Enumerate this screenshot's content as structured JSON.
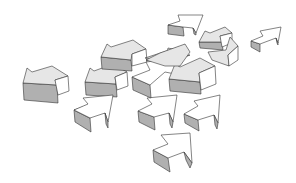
{
  "illustration": {
    "title": "",
    "description": "Scattered 3D arrows pointing in different directions",
    "colors": {
      "background": "#ffffff",
      "top_face": "#e6e6e6",
      "side_face": "#b0b0b0",
      "light_face": "#ffffff",
      "stroke": "#333333"
    },
    "arrows": [
      {
        "name": "arrow-left-far",
        "faces": [
          {
            "pts": "23,83 57,85 58,103 24,100",
            "fill": "#b0b0b0"
          },
          {
            "pts": "23,83 27,68 32,72 52,66 68,76 55,80 57,85",
            "fill": "#e6e6e6"
          },
          {
            "pts": "55,80 68,76 69,91 58,95",
            "fill": "#ffffff"
          }
        ]
      },
      {
        "name": "arrow-left-mid",
        "faces": [
          {
            "pts": "85,82 116,84 117,97 86,95",
            "fill": "#b0b0b0"
          },
          {
            "pts": "85,82 90,68 94,71 113,64 127,72 115,77 116,84",
            "fill": "#e6e6e6"
          },
          {
            "pts": "115,77 127,72 128,86 117,90",
            "fill": "#ffffff"
          }
        ]
      },
      {
        "name": "arrow-left-upper",
        "faces": [
          {
            "pts": "101,57 131,60 132,71 102,69",
            "fill": "#b0b0b0"
          },
          {
            "pts": "101,57 107,44 111,47 133,40 146,49 132,54 131,60",
            "fill": "#e6e6e6"
          },
          {
            "pts": "132,54 146,49 147,62 132,66",
            "fill": "#ffffff"
          }
        ]
      },
      {
        "name": "arrow-upright-left",
        "faces": [
          {
            "pts": "74,110 90,118 91,132 75,122",
            "fill": "#b0b0b0"
          },
          {
            "pts": "74,110 96,102 90,118",
            "fill": "#ffffff"
          },
          {
            "pts": "74,110 88,104 83,98 113,95 108,122 105,113 90,118",
            "fill": "#ffffff"
          },
          {
            "pts": "105,113 108,122 108,128 106,124",
            "fill": "#b0b0b0"
          }
        ]
      },
      {
        "name": "arrow-upright-center",
        "faces": [
          {
            "pts": "138,111 154,117 155,130 139,122",
            "fill": "#b0b0b0"
          },
          {
            "pts": "138,111 152,104 147,98 177,95 173,122 169,113 154,117",
            "fill": "#ffffff"
          },
          {
            "pts": "169,113 173,122 172,128 170,124",
            "fill": "#b0b0b0"
          }
        ]
      },
      {
        "name": "arrow-upright-right",
        "faces": [
          {
            "pts": "184,114 198,120 199,131 185,123",
            "fill": "#b0b0b0"
          },
          {
            "pts": "184,114 198,106 194,101 220,95 218,123 214,115 198,120",
            "fill": "#ffffff"
          },
          {
            "pts": "214,115 218,123 217,129 215,125",
            "fill": "#b0b0b0"
          }
        ]
      },
      {
        "name": "arrow-upright-bottom",
        "faces": [
          {
            "pts": "153,150 168,158 170,172 154,162",
            "fill": "#b0b0b0"
          },
          {
            "pts": "153,150 168,144 161,135 190,133 192,163 184,152 168,158",
            "fill": "#ffffff"
          },
          {
            "pts": "184,152 192,163 190,168 186,160",
            "fill": "#b0b0b0"
          }
        ]
      },
      {
        "name": "arrow-mid-cluster-a",
        "faces": [
          {
            "pts": "132,77 150,85 151,98 133,90",
            "fill": "#b0b0b0"
          },
          {
            "pts": "132,77 150,70 146,62 180,58 175,74 165,72 150,85",
            "fill": "#ffffff"
          },
          {
            "pts": "145,58 185,45 165,60",
            "fill": "#e6e6e6"
          }
        ]
      },
      {
        "name": "arrow-mid-cluster-b",
        "faces": [
          {
            "pts": "169,79 200,82 201,94 170,91",
            "fill": "#b0b0b0"
          },
          {
            "pts": "169,79 175,64 180,67 200,58 215,66 199,73 200,82",
            "fill": "#e6e6e6"
          },
          {
            "pts": "199,73 215,66 216,84 201,90",
            "fill": "#ffffff"
          }
        ]
      },
      {
        "name": "arrow-center-large",
        "faces": [
          {
            "pts": "146,60 165,62 168,48 186,52 172,62 190,55",
            "fill": "#e6e6e6"
          },
          {
            "pts": "146,60 160,53 185,44 190,52 180,66 165,66",
            "fill": "#e6e6e6"
          }
        ]
      },
      {
        "name": "arrow-top-right-cluster",
        "faces": [
          {
            "pts": "199,42 222,42 223,50 200,48",
            "fill": "#b0b0b0"
          },
          {
            "pts": "199,42 205,31 210,33 225,27 232,33 220,36 222,42",
            "fill": "#e6e6e6"
          },
          {
            "pts": "220,36 232,33 232,43 222,47",
            "fill": "#ffffff"
          }
        ]
      },
      {
        "name": "arrow-top-center",
        "faces": [
          {
            "pts": "168,25 183,27 184,36 168,34",
            "fill": "#b0b0b0"
          },
          {
            "pts": "168,25 180,21 178,15 203,15 196,33 193,28 183,27",
            "fill": "#ffffff"
          },
          {
            "pts": "193,28 196,33 196,35 194,34",
            "fill": "#b0b0b0"
          }
        ]
      },
      {
        "name": "arrow-right-cluster",
        "faces": [
          {
            "pts": "208,52 226,50 230,37 238,46 228,55 229,66 212,60",
            "fill": "#e6e6e6"
          },
          {
            "pts": "228,55 238,46 238,60 229,66",
            "fill": "#ffffff"
          }
        ]
      },
      {
        "name": "arrow-far-right",
        "faces": [
          {
            "pts": "251,41 260,44 260,52 251,47",
            "fill": "#b0b0b0"
          },
          {
            "pts": "251,41 263,36 260,31 281,27 278,43 276,38 260,44",
            "fill": "#ffffff"
          },
          {
            "pts": "276,38 278,43 278,45 277,43",
            "fill": "#b0b0b0"
          }
        ]
      }
    ]
  }
}
